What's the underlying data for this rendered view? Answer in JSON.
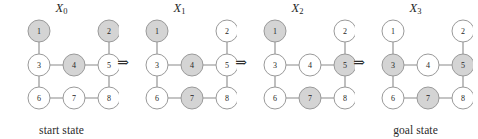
{
  "figure": {
    "caption_start": "start state",
    "caption_goal": "goal state",
    "arrow_glyph": "⇒",
    "colors": {
      "node_shaded_fill": "#d4d4d4",
      "node_plain_fill": "#ffffff",
      "node_stroke": "#9a9a9a",
      "edge_stroke": "#8a8a8a",
      "text": "#1f1f1f",
      "background": "#ffffff"
    },
    "layout": {
      "node_radius": 11,
      "columns_x": [
        35,
        70,
        105
      ],
      "rows_y": [
        14,
        48,
        81
      ]
    },
    "node_positions": {
      "1": {
        "col": 0,
        "row": 0
      },
      "2": {
        "col": 2,
        "row": 0
      },
      "3": {
        "col": 0,
        "row": 1
      },
      "4": {
        "col": 1,
        "row": 1
      },
      "5": {
        "col": 2,
        "row": 1
      },
      "6": {
        "col": 0,
        "row": 2
      },
      "7": {
        "col": 1,
        "row": 2
      },
      "8": {
        "col": 2,
        "row": 2
      }
    },
    "edges": [
      [
        "1",
        "3"
      ],
      [
        "2",
        "5"
      ],
      [
        "3",
        "4"
      ],
      [
        "4",
        "5"
      ],
      [
        "3",
        "6"
      ],
      [
        "5",
        "8"
      ],
      [
        "6",
        "7"
      ],
      [
        "7",
        "8"
      ]
    ],
    "node_order": [
      "1",
      "2",
      "3",
      "4",
      "5",
      "6",
      "7",
      "8"
    ],
    "panels": [
      {
        "id": "X0",
        "title_base": "X",
        "title_sub": "0",
        "caption": "start state",
        "shaded": [
          "1",
          "2",
          "4"
        ]
      },
      {
        "id": "X1",
        "title_base": "X",
        "title_sub": "1",
        "caption": "",
        "shaded": [
          "1",
          "4",
          "7"
        ]
      },
      {
        "id": "X2",
        "title_base": "X",
        "title_sub": "2",
        "caption": "",
        "shaded": [
          "1",
          "5",
          "7"
        ]
      },
      {
        "id": "X3",
        "title_base": "X",
        "title_sub": "3",
        "caption": "goal state",
        "shaded": [
          "3",
          "5",
          "7"
        ]
      }
    ],
    "arrows": [
      "⇒",
      "⇒",
      "⇒"
    ]
  }
}
